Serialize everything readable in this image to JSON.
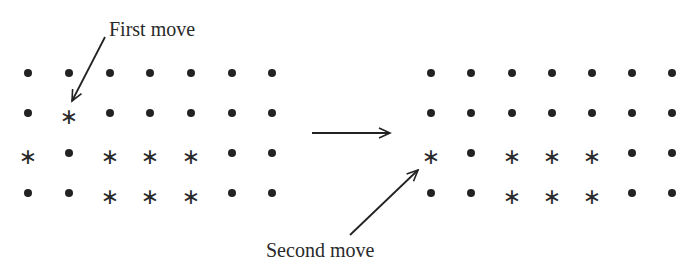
{
  "labels": {
    "first_move": "First move",
    "second_move": "Second move"
  },
  "symbols": {
    "dot": "•",
    "star": "∗"
  },
  "colors": {
    "ink": "#222222",
    "background": "#ffffff"
  },
  "left_grid": {
    "columns_x": [
      28,
      69,
      110,
      150,
      191,
      232,
      272
    ],
    "rows_y": [
      73,
      113,
      153,
      193
    ],
    "rows": [
      [
        ".",
        ".",
        ".",
        ".",
        ".",
        ".",
        "."
      ],
      [
        ".",
        "*",
        ".",
        ".",
        ".",
        ".",
        "."
      ],
      [
        "*",
        ".",
        "*",
        "*",
        "*",
        ".",
        "."
      ],
      [
        ".",
        ".",
        "*",
        "*",
        "*",
        ".",
        "."
      ]
    ]
  },
  "right_grid": {
    "columns_x": [
      431,
      471,
      512,
      552,
      592,
      632,
      672
    ],
    "rows_y": [
      73,
      113,
      153,
      193
    ],
    "rows": [
      [
        ".",
        ".",
        ".",
        ".",
        ".",
        ".",
        "."
      ],
      [
        ".",
        ".",
        ".",
        ".",
        ".",
        ".",
        "."
      ],
      [
        "*",
        ".",
        "*",
        "*",
        "*",
        ".",
        "."
      ],
      [
        ".",
        ".",
        "*",
        "*",
        "*",
        ".",
        "."
      ]
    ]
  },
  "arrows": {
    "first_move": {
      "x1": 105,
      "y1": 37,
      "x2": 72,
      "y2": 101
    },
    "transition": {
      "x1": 312,
      "y1": 133,
      "x2": 390,
      "y2": 133
    },
    "second_move": {
      "x1": 350,
      "y1": 235,
      "x2": 418,
      "y2": 170
    }
  }
}
